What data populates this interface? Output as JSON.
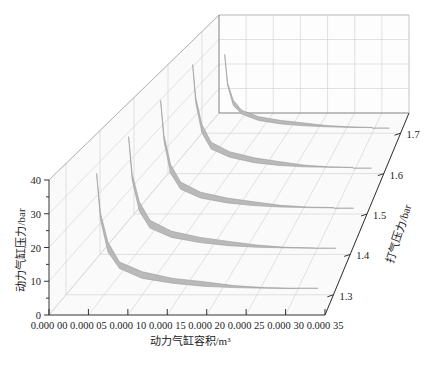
{
  "chart_data": {
    "type": "3d-ribbon",
    "title": "",
    "xlabel": "动力气缸容积/m³",
    "ylabel": "动力气缸压力/bar",
    "zlabel": "打气压力/bar",
    "x_ticks": [
      "0.000 00",
      "0.000 05",
      "0.000 10",
      "0.000 15",
      "0.000 20",
      "0.000 25",
      "0.000 30",
      "0.000 35"
    ],
    "x_range": [
      0.0,
      0.00035
    ],
    "y_ticks": [
      "0",
      "10",
      "20",
      "30",
      "40"
    ],
    "y_range": [
      0,
      40
    ],
    "z_ticks": [
      "1.3",
      "1.4",
      "1.5",
      "1.6",
      "1.7"
    ],
    "grid": true,
    "legend": null,
    "series": [
      {
        "name": "1.3",
        "volume": [
          4e-05,
          4.5e-05,
          5.5e-05,
          7e-05,
          0.0001,
          0.00014,
          0.00018,
          0.00022,
          0.00026,
          0.0003
        ],
        "pressure_upper": [
          37,
          25,
          16,
          10,
          7,
          5,
          4,
          2.8,
          2.2,
          2.0
        ],
        "pressure_lower": [
          37,
          23,
          13,
          8,
          5,
          3.5,
          2.6,
          2.2,
          2.0,
          1.9
        ]
      },
      {
        "name": "1.4",
        "volume": [
          4e-05,
          4.5e-05,
          5.5e-05,
          7e-05,
          0.0001,
          0.00014,
          0.00018,
          0.00022,
          0.00026,
          0.0003
        ],
        "pressure_upper": [
          38,
          26,
          17,
          11,
          7.5,
          5.5,
          4.2,
          3.0,
          2.3,
          2.1
        ],
        "pressure_lower": [
          38,
          24,
          14,
          8.5,
          5.5,
          3.8,
          2.8,
          2.3,
          2.1,
          2.0
        ]
      },
      {
        "name": "1.5",
        "volume": [
          4e-05,
          4.5e-05,
          5.5e-05,
          7e-05,
          0.0001,
          0.00014,
          0.00018,
          0.00022,
          0.00026,
          0.0003
        ],
        "pressure_upper": [
          39,
          27,
          17,
          11,
          7.5,
          5.5,
          4.2,
          3.0,
          2.4,
          2.2
        ],
        "pressure_lower": [
          39,
          25,
          14,
          8.5,
          5.5,
          3.8,
          2.9,
          2.4,
          2.2,
          2.1
        ]
      },
      {
        "name": "1.6",
        "volume": [
          4e-05,
          4.5e-05,
          5.5e-05,
          7e-05,
          0.0001,
          0.00014,
          0.00018,
          0.00022,
          0.00026,
          0.0003
        ],
        "pressure_upper": [
          40,
          28,
          18,
          11.5,
          8,
          5.8,
          4.4,
          3.1,
          2.5,
          2.3
        ],
        "pressure_lower": [
          40,
          26,
          15,
          9,
          6,
          4,
          3.0,
          2.5,
          2.3,
          2.2
        ]
      },
      {
        "name": "1.7",
        "volume": [
          4e-05,
          4.5e-05,
          5.5e-05,
          7e-05,
          0.0001,
          0.00014,
          0.00018,
          0.00022,
          0.00026,
          0.0003
        ],
        "pressure_upper": [
          31,
          20,
          13,
          9,
          6.5,
          5,
          4,
          3.0,
          2.5,
          2.3
        ],
        "pressure_lower": [
          31,
          19,
          11,
          7.5,
          5,
          3.6,
          2.9,
          2.5,
          2.3,
          2.2
        ]
      }
    ]
  },
  "colors": {
    "ribbon_fill": "#b9b9b9",
    "ribbon_edge": "#9a9a9a",
    "grid": "#d4d4d4",
    "axis": "#333333",
    "wall": "#fafafa"
  }
}
